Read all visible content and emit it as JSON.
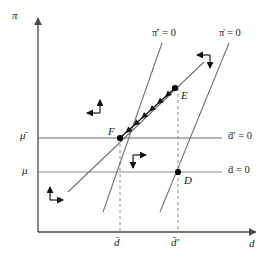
{
  "figure": {
    "type": "diagram"
  },
  "axes": {
    "y_label": "π",
    "x_label": "d",
    "origin": {
      "x": 38,
      "y": 232
    },
    "x_end": {
      "x": 258,
      "y": 232
    },
    "y_top": {
      "x": 38,
      "y": 16
    }
  },
  "y_ticks": [
    {
      "label": "μ̄",
      "name": "mu-bar",
      "y": 138
    },
    {
      "label": "μ",
      "name": "mu",
      "y": 172
    }
  ],
  "x_ticks": [
    {
      "label": "d̄",
      "name": "d-bar",
      "x": 120
    },
    {
      "label": "d̄′",
      "name": "d-bar-prime",
      "x": 178
    }
  ],
  "curve_labels": [
    {
      "id": "pi-dot-prime",
      "label": "π̇′ = 0",
      "x": 152,
      "y": 32
    },
    {
      "id": "pi-dot",
      "label": "π̇ = 0",
      "x": 219,
      "y": 32
    },
    {
      "id": "d-dot-prime",
      "label": "ḋ′ = 0",
      "x": 228,
      "y": 132
    },
    {
      "id": "d-dot",
      "label": "ḋ = 0",
      "x": 228,
      "y": 166
    }
  ],
  "points": [
    {
      "id": "E",
      "label": "E",
      "x": 175,
      "y": 88,
      "label_dx": 6,
      "label_dy": 8
    },
    {
      "id": "F",
      "label": "F",
      "x": 120,
      "y": 138,
      "label_dx": -12,
      "label_dy": -5
    },
    {
      "id": "D",
      "label": "D",
      "x": 178,
      "y": 172,
      "label_dx": 6,
      "label_dy": 10
    }
  ],
  "lines": {
    "pi_dot_prime_locus": {
      "x1": 103,
      "y1": 212,
      "x2": 162,
      "y2": 43
    },
    "pi_dot_locus": {
      "x1": 160,
      "y1": 212,
      "x2": 229,
      "y2": 43
    },
    "d_dot_prime_locus": {
      "x1": 38,
      "y1": 138,
      "x2": 222,
      "y2": 138
    },
    "d_dot_locus": {
      "x1": 38,
      "y1": 172,
      "x2": 222,
      "y2": 172
    },
    "extra_shallow": {
      "x1": 68,
      "y1": 192,
      "x2": 204,
      "y2": 62
    }
  },
  "dashed_lines": [
    {
      "id": "d-bar-drop",
      "x": 120,
      "y1": 138,
      "y2": 232
    },
    {
      "id": "d-bar-prime-drop",
      "x": 178,
      "y1": 88,
      "y2": 232
    }
  ],
  "saddle_path": {
    "from_x": 175,
    "from_y": 88,
    "to_x": 120,
    "to_y": 138,
    "arrow_count": 6
  },
  "direction_crosses": [
    {
      "id": "upper-left",
      "vertical": "up",
      "horizontal": "left",
      "cx": 100,
      "cy": 113
    },
    {
      "id": "lower-left",
      "vertical": "up",
      "horizontal": "right",
      "cx": 50,
      "cy": 200
    },
    {
      "id": "middle",
      "vertical": "down",
      "horizontal": "right",
      "cx": 133,
      "cy": 155
    },
    {
      "id": "upper-right",
      "vertical": "down",
      "horizontal": "left",
      "cx": 210,
      "cy": 55
    }
  ],
  "colors": {
    "axis": "#4a4a4a",
    "locus": "#6f6f6f",
    "dashed": "#7a7a7a",
    "saddle": "#111111",
    "point": "#000000",
    "text": "#1a1a1a"
  }
}
